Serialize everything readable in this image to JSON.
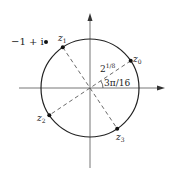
{
  "diagram": {
    "type": "complex-plane-roots",
    "point_outside": {
      "label": "-1 + i",
      "display": "−1 + i"
    },
    "radius_label": {
      "base": "2",
      "exponent": "1/8"
    },
    "angle_label": "3π/16",
    "roots": [
      {
        "name": "z",
        "sub": "0",
        "angle_rad_over_pi": 0.1875
      },
      {
        "name": "z",
        "sub": "1",
        "angle_rad_over_pi": 0.6875
      },
      {
        "name": "z",
        "sub": "2",
        "angle_rad_over_pi": 1.1875
      },
      {
        "name": "z",
        "sub": "3",
        "angle_rad_over_pi": 1.6875
      }
    ],
    "colors": {
      "ink": "#222222",
      "axis": "#777777",
      "background": "#ffffff"
    }
  }
}
